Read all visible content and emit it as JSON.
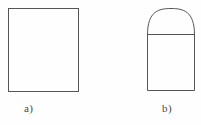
{
  "figure": {
    "background_color": "#fefefe",
    "stroke_color": "#555555",
    "stroke_width": 1,
    "fill_color": "none",
    "caption_color": "#4a4a4a",
    "shapes": [
      {
        "id": "shape-a",
        "name": "square",
        "label": "a)",
        "description": "plain rectangle outline",
        "x": 8,
        "y": 8,
        "width": 70,
        "height": 83
      },
      {
        "id": "shape-b",
        "name": "arched-rectangle",
        "label": "b)",
        "description": "rectangle with semicircular arch on top, divided by a horizontal chord line",
        "x": 147,
        "y": 34,
        "width": 47,
        "height": 56,
        "arch_top_y": 8,
        "arch_height": 26,
        "chord_y": 34
      }
    ],
    "labels": [
      {
        "id": "label-a",
        "text": "a)",
        "x": 24,
        "y": 102
      },
      {
        "id": "label-b",
        "text": "b)",
        "x": 162,
        "y": 102
      }
    ]
  }
}
